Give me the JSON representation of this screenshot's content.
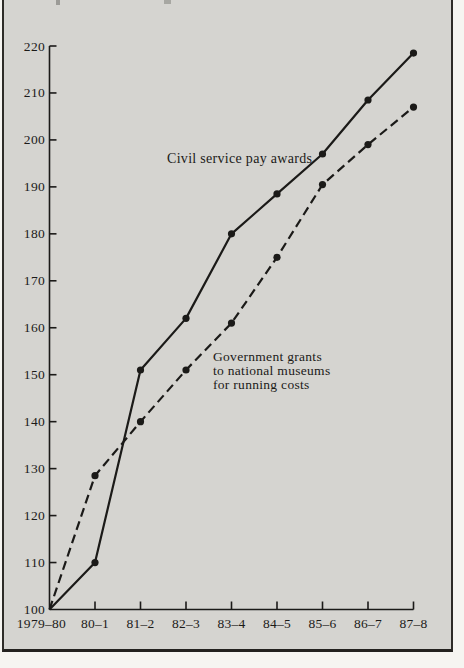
{
  "frame": {
    "background": "#d5d4d0",
    "border_color": "#2e2c28",
    "outer_background": "#f6f5f1",
    "ink": "#1b1a18"
  },
  "chart_data": {
    "type": "line",
    "categories": [
      "1979–80",
      "80–1",
      "81–2",
      "82–3",
      "83–4",
      "84–5",
      "85–6",
      "86–7",
      "87–8"
    ],
    "series": [
      {
        "name": "Civil service pay awards",
        "style": "solid",
        "marker": "filled-circle",
        "values": [
          100,
          110,
          151,
          162,
          180,
          188.5,
          197,
          208.5,
          218.5
        ]
      },
      {
        "name": "Government grants to national museums for running costs",
        "style": "dashed",
        "marker": "filled-circle",
        "values": [
          100,
          128.5,
          140,
          151,
          161,
          175,
          190.5,
          199,
          207
        ]
      }
    ],
    "y_ticks": [
      100,
      110,
      120,
      130,
      140,
      150,
      160,
      170,
      180,
      190,
      200,
      210,
      220
    ],
    "ylim": [
      100,
      220
    ],
    "grid": false,
    "legend_position": "inline-annotations"
  },
  "annotations": {
    "solid_label": "Civil service pay awards",
    "dashed_label": "Government grants\nto national museums\nfor running costs"
  }
}
